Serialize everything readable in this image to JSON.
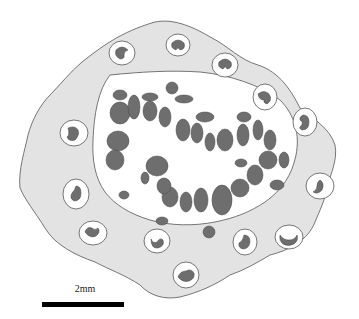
{
  "figure": {
    "colors": {
      "background": "#ffffff",
      "ring_fill": "#e3e3e3",
      "lumen_fill": "#ffffff",
      "outline": "#555555",
      "body_fill": "#6e6e6e",
      "halo_fill": "#ffffff",
      "scale_bar": "#000000"
    },
    "peripheral_unit_count": 15
  },
  "scale": {
    "label": "2mm"
  }
}
